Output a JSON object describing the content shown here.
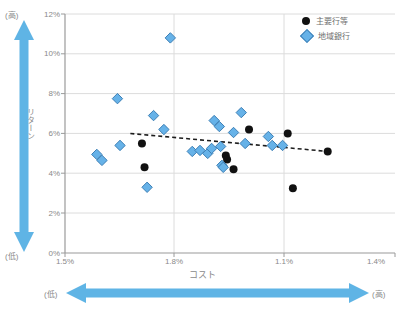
{
  "chart_data": {
    "type": "scatter",
    "title": "",
    "xlabel": "コスト",
    "ylabel": "リターン",
    "xlim": [
      1.5,
      1.4
    ],
    "ylim": [
      0,
      12
    ],
    "grid": true,
    "legend_position": "top-right",
    "x_tick_labels": [
      "1.5%",
      "1.8%",
      "1.1%",
      "1.4%"
    ],
    "y_tick_labels": [
      "0%",
      "2%",
      "4%",
      "6%",
      "8%",
      "10%",
      "12%"
    ],
    "annotations": {
      "y_axis_top": "(高)",
      "y_axis_bottom": "(低)",
      "x_axis_left": "(低)",
      "x_axis_right": "(高)"
    },
    "series": [
      {
        "name": "主要行等",
        "marker": "circle",
        "color": "#111111",
        "points": [
          {
            "x": 1.735,
            "y": 5.5
          },
          {
            "x": 1.737,
            "y": 4.3
          },
          {
            "x": 1.8,
            "y": 4.9
          },
          {
            "x": 1.801,
            "y": 4.7
          },
          {
            "x": 1.806,
            "y": 4.2
          },
          {
            "x": 1.818,
            "y": 6.2
          },
          {
            "x": 1.848,
            "y": 6.0
          },
          {
            "x": 1.852,
            "y": 3.25
          },
          {
            "x": 1.879,
            "y": 5.1
          }
        ]
      },
      {
        "name": "地域銀行",
        "marker": "diamond",
        "color": "#66b2e8",
        "points": [
          {
            "x": 1.716,
            "y": 7.75
          },
          {
            "x": 1.7,
            "y": 4.95
          },
          {
            "x": 1.704,
            "y": 4.65
          },
          {
            "x": 1.718,
            "y": 5.4
          },
          {
            "x": 1.744,
            "y": 6.9
          },
          {
            "x": 1.752,
            "y": 6.2
          },
          {
            "x": 1.757,
            "y": 10.8
          },
          {
            "x": 1.739,
            "y": 3.3
          },
          {
            "x": 1.774,
            "y": 5.1
          },
          {
            "x": 1.786,
            "y": 5.0
          },
          {
            "x": 1.789,
            "y": 5.25
          },
          {
            "x": 1.791,
            "y": 6.65
          },
          {
            "x": 1.795,
            "y": 6.35
          },
          {
            "x": 1.796,
            "y": 5.35
          },
          {
            "x": 1.797,
            "y": 4.4
          },
          {
            "x": 1.798,
            "y": 4.3
          },
          {
            "x": 1.806,
            "y": 6.05
          },
          {
            "x": 1.812,
            "y": 7.05
          },
          {
            "x": 1.815,
            "y": 5.5
          },
          {
            "x": 1.833,
            "y": 5.85
          },
          {
            "x": 1.836,
            "y": 5.4
          },
          {
            "x": 1.844,
            "y": 5.4
          },
          {
            "x": 1.78,
            "y": 5.15
          }
        ]
      }
    ],
    "trendline": {
      "style": "dashed",
      "color": "#1c1c1c",
      "x_start": 1.726,
      "y_start": 6.0,
      "x_end": 1.879,
      "y_end": 5.1
    }
  },
  "legend": {
    "items": [
      {
        "label": "主要行等",
        "marker": "circle"
      },
      {
        "label": "地域銀行",
        "marker": "diamond"
      }
    ]
  },
  "axes": {
    "y_ticks": [
      "12%",
      "10%",
      "8%",
      "6%",
      "4%",
      "2%",
      "0%"
    ],
    "x_ticks": [
      "1.5%",
      "1.8%",
      "1.1%",
      "1.4%"
    ],
    "y_title": "リターン",
    "x_title": "コスト"
  },
  "annotations": {
    "top_left": "(高)",
    "bottom_left": "(低)",
    "bottom_arrow_left": "(低)",
    "bottom_arrow_right": "(高)"
  },
  "colors": {
    "diamond_fill": "#66b2e8",
    "diamond_stroke": "#3d7fb5",
    "circle_fill": "#111111",
    "arrow_blue": "#5fb4e5",
    "grid": "#dcdcdc",
    "axis": "#9a9a9a"
  }
}
